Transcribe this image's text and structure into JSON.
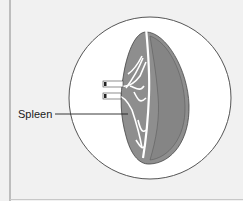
{
  "diagram": {
    "labels": [
      {
        "text": "Spleen",
        "target": "spleen-organ"
      }
    ],
    "colors": {
      "background": "#f1f1f1",
      "circle_fill": "#ffffff",
      "circle_stroke": "#555555",
      "organ_fill": "#8c8c8c",
      "organ_dark": "#7a7a7a",
      "vessels": "#ffffff",
      "leader_line": "#222222"
    }
  }
}
